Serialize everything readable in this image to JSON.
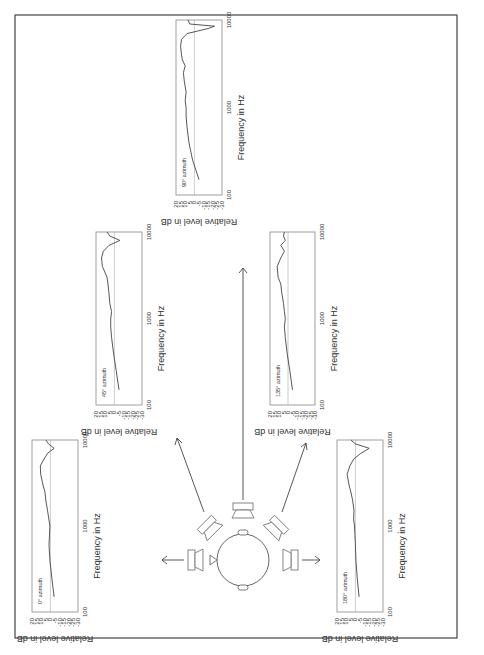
{
  "figure": {
    "center": {
      "head": "head-icon",
      "speakers": [
        "0",
        "45",
        "90",
        "135",
        "180"
      ]
    }
  },
  "common": {
    "xlabel": "Frequency in Hz",
    "ylabel": "Relative level in dB",
    "xticks": [
      "100",
      "1000",
      "10000"
    ],
    "yticks": [
      "20",
      "15",
      "10",
      "5",
      "0",
      "-5",
      "-10",
      "-15",
      "-20",
      "-25",
      "-30"
    ]
  },
  "panels": [
    {
      "id": "az0",
      "label": "0° azimuth"
    },
    {
      "id": "az45",
      "label": "45° azimuth"
    },
    {
      "id": "az90",
      "label": "90° azimuth"
    },
    {
      "id": "az135",
      "label": "135° azimuth"
    },
    {
      "id": "az180",
      "label": "180° azimuth"
    }
  ],
  "chart_data": [
    {
      "type": "line",
      "title": "0° azimuth",
      "xlabel": "Frequency in Hz",
      "ylabel": "Relative level in dB",
      "xscale": "log",
      "xlim": [
        100,
        10000
      ],
      "ylim": [
        -30,
        20
      ],
      "x": [
        150,
        250,
        400,
        600,
        800,
        1000,
        1500,
        2000,
        2500,
        3000,
        4000,
        5000,
        6000,
        7000,
        8000,
        9000,
        10000
      ],
      "values": [
        -4,
        -1.5,
        0.5,
        1.5,
        1,
        0.5,
        3,
        5,
        6,
        8,
        10.5,
        11,
        7,
        3,
        -4,
        2,
        5
      ]
    },
    {
      "type": "line",
      "title": "45° azimuth",
      "xlabel": "Frequency in Hz",
      "ylabel": "Relative level in dB",
      "xscale": "log",
      "xlim": [
        100,
        10000
      ],
      "ylim": [
        -30,
        20
      ],
      "x": [
        150,
        250,
        400,
        600,
        800,
        1000,
        1200,
        1500,
        2000,
        2500,
        3000,
        4000,
        5000,
        6000,
        7000,
        8000,
        9000,
        10000
      ],
      "values": [
        -5,
        -2,
        1,
        3,
        4,
        4,
        3,
        5,
        6,
        7,
        8,
        13,
        14,
        12,
        6,
        -6,
        5,
        8
      ]
    },
    {
      "type": "line",
      "title": "90° azimuth",
      "xlabel": "Frequency in Hz",
      "ylabel": "Relative level in dB",
      "xscale": "log",
      "xlim": [
        100,
        10000
      ],
      "ylim": [
        -30,
        20
      ],
      "x": [
        150,
        250,
        400,
        600,
        800,
        1000,
        1200,
        1500,
        2000,
        2500,
        3000,
        3500,
        4000,
        5000,
        6000,
        7000,
        8000,
        8500,
        9000,
        10000
      ],
      "values": [
        -5,
        2,
        6,
        8,
        9,
        9,
        10,
        9,
        11,
        12,
        10,
        13,
        14,
        15,
        14,
        8,
        -15,
        -22,
        5,
        7
      ]
    },
    {
      "type": "line",
      "title": "135° azimuth",
      "xlabel": "Frequency in Hz",
      "ylabel": "Relative level in dB",
      "xscale": "log",
      "xlim": [
        100,
        10000
      ],
      "ylim": [
        -30,
        20
      ],
      "x": [
        150,
        250,
        400,
        600,
        800,
        1000,
        1200,
        1500,
        2000,
        2500,
        3000,
        4000,
        5000,
        6000,
        7000,
        8000,
        9000,
        10000
      ],
      "values": [
        -5,
        -2,
        1,
        3,
        4,
        3,
        4,
        5,
        7,
        8,
        11,
        12,
        8,
        4,
        8,
        3,
        5,
        4
      ]
    },
    {
      "type": "line",
      "title": "180° azimuth",
      "xlabel": "Frequency in Hz",
      "ylabel": "Relative level in dB",
      "xscale": "log",
      "xlim": [
        100,
        10000
      ],
      "ylim": [
        -30,
        20
      ],
      "x": [
        150,
        250,
        400,
        600,
        800,
        1000,
        1200,
        1500,
        2000,
        2500,
        3000,
        4000,
        5000,
        6000,
        7000,
        8000,
        9000,
        10000
      ],
      "values": [
        -4,
        -2,
        -0.5,
        0,
        0.5,
        1,
        2,
        1.5,
        3,
        5,
        7,
        9,
        6,
        2,
        -6,
        -15,
        0,
        5
      ]
    }
  ]
}
